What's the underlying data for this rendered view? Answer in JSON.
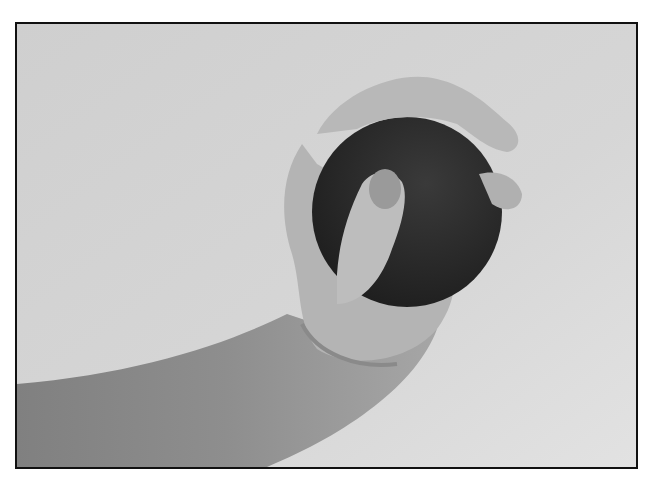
{
  "image": {
    "description": "Grayscale photograph of a hand squeezing a dark ball",
    "colors": {
      "border": "#111111",
      "background": "#d2d2d2",
      "background_light": "#e0e0e0",
      "skin": "#b8b8b8",
      "skin_shadow": "#8f8f8f",
      "skin_dark": "#7a7a7a",
      "ball": "#2e2e2e",
      "ball_shadow": "#1c1c1c"
    }
  }
}
